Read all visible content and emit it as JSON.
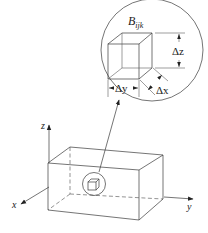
{
  "diagram": {
    "type": "3d-coordinate-box-with-magnified-cell",
    "labels": {
      "block": "B",
      "block_subscript": "ijk",
      "delta_z": "Δz",
      "delta_y": "Δy",
      "delta_x": "Δx",
      "axis_x": "x",
      "axis_y": "y",
      "axis_z": "z"
    },
    "colors": {
      "line": "#3a3a3a",
      "background": "#ffffff"
    }
  }
}
